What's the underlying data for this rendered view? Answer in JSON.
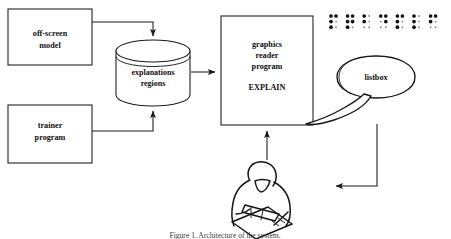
{
  "diagram": {
    "background_color": "#ffffff",
    "line_color": "#1a1a1a",
    "text_color": "#101010",
    "nodes": [
      {
        "id": "off-screen-model",
        "shape": "rectangle",
        "lines": [
          "off-screen",
          "model"
        ],
        "x": 8,
        "y": 9,
        "w": 84,
        "h": 56
      },
      {
        "id": "trainer-program",
        "shape": "rectangle",
        "lines": [
          "trainer",
          "program"
        ],
        "x": 8,
        "y": 105,
        "w": 84,
        "h": 58
      },
      {
        "id": "explanations-regions-store",
        "shape": "cylinder",
        "lines": [
          "explanations",
          "regions"
        ],
        "x": 116,
        "y": 41,
        "w": 74,
        "h": 64
      },
      {
        "id": "graphics-reader-program",
        "shape": "rectangle",
        "lines": [
          "graphics",
          "reader",
          "program",
          "",
          "EXPLAIN"
        ],
        "x": 221,
        "y": 16,
        "w": 92,
        "h": 109
      }
    ],
    "edges": [
      {
        "id": "model-to-store",
        "from": "off-screen-model",
        "to": "explanations-regions-store",
        "arrow": "down"
      },
      {
        "id": "trainer-to-store",
        "from": "trainer-program",
        "to": "explanations-regions-store",
        "arrow": "up"
      },
      {
        "id": "store-to-reader",
        "from": "explanations-regions-store",
        "to": "graphics-reader-program",
        "arrow": "right"
      },
      {
        "id": "user-to-reader",
        "from": "tactile-reader-person",
        "to": "graphics-reader-program",
        "arrow": "up"
      },
      {
        "id": "bubble-to-user",
        "from": "listbox-speech-bubble",
        "to": "tactile-reader-person",
        "arrow": "left"
      }
    ],
    "speech_bubble": {
      "id": "listbox-speech-bubble",
      "label": "listbox",
      "x": 337,
      "y": 56,
      "w": 78,
      "h": 42
    },
    "braille_row": {
      "id": "braille-output",
      "cell_count": 7,
      "description": "braille display output cells",
      "cells": [
        {
          "index": 1,
          "dots": [
            1,
            1,
            1,
            0,
            1,
            0
          ]
        },
        {
          "index": 2,
          "dots": [
            1,
            1,
            1,
            1,
            1,
            0
          ]
        },
        {
          "index": 3,
          "dots": [
            1,
            0,
            1,
            0,
            0,
            0
          ]
        },
        {
          "index": 4,
          "dots": [
            1,
            1,
            0,
            1,
            0,
            0
          ]
        },
        {
          "index": 5,
          "dots": [
            1,
            1,
            1,
            0,
            1,
            0
          ]
        },
        {
          "index": 6,
          "dots": [
            1,
            0,
            1,
            0,
            1,
            0
          ]
        },
        {
          "index": 7,
          "dots": [
            1,
            1,
            1,
            0,
            0,
            0
          ]
        }
      ]
    },
    "person": {
      "id": "tactile-reader-person",
      "description": "person reading a tactile graphic sheet"
    },
    "caption": {
      "text": "Figure 1. Architecture of the system.",
      "visible": "partially cut off at bottom edge"
    }
  }
}
